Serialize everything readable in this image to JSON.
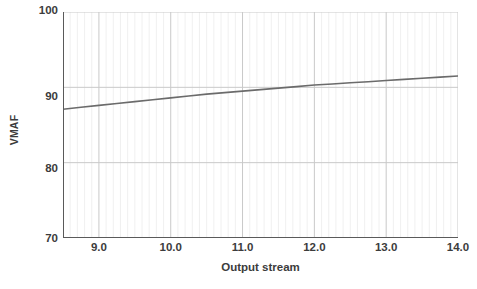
{
  "chart_data": {
    "type": "line",
    "title": "",
    "xlabel": "Output stream",
    "ylabel": "VMAF",
    "xlim": [
      8.5,
      14.0
    ],
    "ylim": [
      70,
      100
    ],
    "grid": true,
    "legend": null,
    "xticks": [
      "9.0",
      "10.0",
      "11.0",
      "12.0",
      "13.0",
      "14.0"
    ],
    "xtick_values": [
      9.0,
      10.0,
      11.0,
      12.0,
      13.0,
      14.0
    ],
    "yticks": [
      "100",
      "90",
      "80",
      "70"
    ],
    "ytick_values": [
      100,
      90,
      80,
      70
    ],
    "minor_gridlines_x_step": 0.1,
    "series": [
      {
        "name": "VMAF",
        "color": "#6b6b6b",
        "x": [
          8.5,
          8.75,
          9.0,
          9.25,
          9.5,
          9.75,
          10.0,
          10.25,
          10.5,
          10.75,
          11.0,
          11.25,
          11.5,
          11.75,
          12.0,
          12.25,
          12.5,
          12.75,
          13.0,
          13.25,
          13.5,
          13.75,
          14.0
        ],
        "y": [
          87.1,
          87.35,
          87.6,
          87.85,
          88.1,
          88.35,
          88.6,
          88.85,
          89.1,
          89.3,
          89.5,
          89.7,
          89.9,
          90.1,
          90.3,
          90.45,
          90.6,
          90.75,
          90.9,
          91.05,
          91.2,
          91.35,
          91.5
        ]
      }
    ]
  },
  "axes": {
    "ylabel": "VMAF",
    "xlabel": "Output stream",
    "ytick_labels": [
      "100",
      "90",
      "80",
      "70"
    ],
    "xtick_labels": [
      "9.0",
      "10.0",
      "11.0",
      "12.0",
      "13.0",
      "14.0"
    ]
  },
  "colors": {
    "line": "#6b6b6b",
    "axis": "#5a5a5a",
    "major_grid": "#c9c9c9",
    "minor_grid": "#ececec",
    "text": "#3c3c3c",
    "background": "#ffffff"
  }
}
